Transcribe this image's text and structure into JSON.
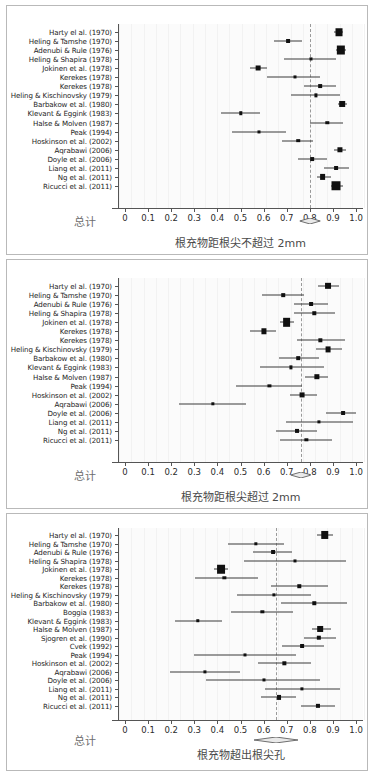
{
  "figure": {
    "panel_count": 3,
    "marker_color": "#101010",
    "ci_color": "#3a3a3a",
    "refline_color": "#9a9a9a",
    "total_label": "总计",
    "axis_ticks": [
      "0",
      "0.1",
      "0.2",
      "0.3",
      "0.4",
      "0.5",
      "0.6",
      "0.7",
      "0.8",
      "0.9",
      "1.0"
    ],
    "axis_tick_values": [
      0,
      0.1,
      0.2,
      0.3,
      0.4,
      0.5,
      0.6,
      0.7,
      0.8,
      0.9,
      1.0
    ]
  },
  "chart_data": [
    {
      "type": "forest",
      "panel_id": 1,
      "title": "",
      "xlabel": "根充物距根尖不超过 2mm",
      "ylabel": "",
      "xlim": [
        -0.03,
        1.03
      ],
      "xticks": [
        0,
        0.1,
        0.2,
        0.3,
        0.4,
        0.5,
        0.6,
        0.7,
        0.8,
        0.9,
        1.0
      ],
      "xticklabels": [
        "0",
        "0.1",
        "0.2",
        "0.3",
        "0.4",
        "0.5",
        "0.6",
        "0.7",
        "0.8",
        "0.9",
        "1.0"
      ],
      "grid": false,
      "legend": "none",
      "reference_line": 0.8,
      "summary": {
        "label": "总计",
        "estimate": 0.8,
        "ci_low": 0.755,
        "ci_high": 0.845
      },
      "studies": [
        {
          "label": "Harty el al. (1970)",
          "estimate": 0.925,
          "ci_low": 0.905,
          "ci_high": 0.945,
          "weight": 4.0
        },
        {
          "label": "Heling & Tamshe (1970)",
          "estimate": 0.705,
          "ci_low": 0.645,
          "ci_high": 0.765,
          "weight": 1.6
        },
        {
          "label": "Adenubi & Rule (1976)",
          "estimate": 0.935,
          "ci_low": 0.915,
          "ci_high": 0.955,
          "weight": 5.0
        },
        {
          "label": "Heling & Shapira (1978)",
          "estimate": 0.805,
          "ci_low": 0.69,
          "ci_high": 0.915,
          "weight": 1.0
        },
        {
          "label": "Jokinen et al. (1978)",
          "estimate": 0.575,
          "ci_low": 0.54,
          "ci_high": 0.615,
          "weight": 2.3
        },
        {
          "label": "Kerekes (1978)",
          "estimate": 0.735,
          "ci_low": 0.615,
          "ci_high": 0.845,
          "weight": 1.0
        },
        {
          "label": "Kerekes (1978)",
          "estimate": 0.845,
          "ci_low": 0.775,
          "ci_high": 0.915,
          "weight": 1.5
        },
        {
          "label": "Heling & Kischinovsky (1979)",
          "estimate": 0.825,
          "ci_low": 0.72,
          "ci_high": 0.93,
          "weight": 1.1
        },
        {
          "label": "Barbakow et al. (1980)",
          "estimate": 0.94,
          "ci_low": 0.92,
          "ci_high": 0.96,
          "weight": 3.0
        },
        {
          "label": "Klevant & Eggink (1983)",
          "estimate": 0.5,
          "ci_low": 0.415,
          "ci_high": 0.585,
          "weight": 1.3
        },
        {
          "label": "Halse & Molven (1987)",
          "estimate": 0.875,
          "ci_low": 0.8,
          "ci_high": 0.945,
          "weight": 1.3
        },
        {
          "label": "Peak (1994)",
          "estimate": 0.58,
          "ci_low": 0.465,
          "ci_high": 0.695,
          "weight": 1.0
        },
        {
          "label": "Hoskinson et al. (2002)",
          "estimate": 0.75,
          "ci_low": 0.68,
          "ci_high": 0.815,
          "weight": 1.4
        },
        {
          "label": "Aqrabawi (2006)",
          "estimate": 0.93,
          "ci_low": 0.905,
          "ci_high": 0.955,
          "weight": 2.6
        },
        {
          "label": "Doyle et al. (2006)",
          "estimate": 0.81,
          "ci_low": 0.75,
          "ci_high": 0.875,
          "weight": 1.5
        },
        {
          "label": "Liang et al. (2011)",
          "estimate": 0.915,
          "ci_low": 0.86,
          "ci_high": 0.97,
          "weight": 1.6
        },
        {
          "label": "Ng et al. (2011)",
          "estimate": 0.855,
          "ci_low": 0.83,
          "ci_high": 0.89,
          "weight": 3.1
        },
        {
          "label": "Ricucci et al. (2011)",
          "estimate": 0.915,
          "ci_low": 0.89,
          "ci_high": 0.945,
          "weight": 5.6
        }
      ]
    },
    {
      "type": "forest",
      "panel_id": 2,
      "title": "",
      "xlabel": "根充物距根尖超过 2mm",
      "ylabel": "",
      "xlim": [
        -0.03,
        1.03
      ],
      "xticks": [
        0,
        0.1,
        0.2,
        0.3,
        0.4,
        0.5,
        0.6,
        0.7,
        0.8,
        0.9,
        1.0
      ],
      "xticklabels": [
        "0",
        "0.1",
        "0.2",
        "0.3",
        "0.4",
        "0.5",
        "0.6",
        "0.7",
        "0.8",
        "0.9",
        "1.0"
      ],
      "grid": false,
      "legend": "none",
      "reference_line": 0.76,
      "summary": {
        "label": "总计",
        "estimate": 0.76,
        "ci_low": 0.715,
        "ci_high": 0.805
      },
      "studies": [
        {
          "label": "Harty el al. (1970)",
          "estimate": 0.88,
          "ci_low": 0.835,
          "ci_high": 0.925,
          "weight": 3.2
        },
        {
          "label": "Heling & Tamshe (1970)",
          "estimate": 0.685,
          "ci_low": 0.595,
          "ci_high": 0.775,
          "weight": 1.4
        },
        {
          "label": "Adenubi & Rule (1976)",
          "estimate": 0.805,
          "ci_low": 0.73,
          "ci_high": 0.88,
          "weight": 1.6
        },
        {
          "label": "Heling & Shapira (1978)",
          "estimate": 0.82,
          "ci_low": 0.73,
          "ci_high": 0.91,
          "weight": 1.3
        },
        {
          "label": "Jokinen et al. (1978)",
          "estimate": 0.7,
          "ci_low": 0.67,
          "ci_high": 0.73,
          "weight": 4.6
        },
        {
          "label": "Kerekes (1978)",
          "estimate": 0.6,
          "ci_low": 0.54,
          "ci_high": 0.655,
          "weight": 2.6
        },
        {
          "label": "Kerekes (1978)",
          "estimate": 0.845,
          "ci_low": 0.745,
          "ci_high": 0.95,
          "weight": 1.2
        },
        {
          "label": "Heling & Kischinovsky (1979)",
          "estimate": 0.88,
          "ci_low": 0.825,
          "ci_high": 0.94,
          "weight": 2.4
        },
        {
          "label": "Barbakow et al. (1980)",
          "estimate": 0.75,
          "ci_low": 0.665,
          "ci_high": 0.84,
          "weight": 1.4
        },
        {
          "label": "Klevant & Eggink (1983)",
          "estimate": 0.72,
          "ci_low": 0.585,
          "ci_high": 0.86,
          "weight": 1.1
        },
        {
          "label": "Halse & Molven (1987)",
          "estimate": 0.83,
          "ci_low": 0.78,
          "ci_high": 0.88,
          "weight": 2.7
        },
        {
          "label": "Peak (1994)",
          "estimate": 0.625,
          "ci_low": 0.48,
          "ci_high": 0.765,
          "weight": 1.1
        },
        {
          "label": "Hoskinson et al. (2002)",
          "estimate": 0.765,
          "ci_low": 0.715,
          "ci_high": 0.83,
          "weight": 2.4
        },
        {
          "label": "Aqrabawi (2006)",
          "estimate": 0.38,
          "ci_low": 0.235,
          "ci_high": 0.525,
          "weight": 1.2
        },
        {
          "label": "Doyle et al. (2006)",
          "estimate": 0.945,
          "ci_low": 0.87,
          "ci_high": 1.0,
          "weight": 1.6
        },
        {
          "label": "Liang et al. (2011)",
          "estimate": 0.84,
          "ci_low": 0.695,
          "ci_high": 0.985,
          "weight": 1.1
        },
        {
          "label": "Ng et al. (2011)",
          "estimate": 0.745,
          "ci_low": 0.655,
          "ci_high": 0.83,
          "weight": 1.7
        },
        {
          "label": "Ricucci et al. (2011)",
          "estimate": 0.785,
          "ci_low": 0.67,
          "ci_high": 0.895,
          "weight": 1.2
        }
      ]
    },
    {
      "type": "forest",
      "panel_id": 3,
      "title": "",
      "xlabel": "根充物超出根尖孔",
      "ylabel": "",
      "xlim": [
        -0.03,
        1.03
      ],
      "xticks": [
        0,
        0.1,
        0.2,
        0.3,
        0.4,
        0.5,
        0.6,
        0.7,
        0.8,
        0.9,
        1.0
      ],
      "xticklabels": [
        "0",
        "0.1",
        "0.2",
        "0.3",
        "0.4",
        "0.5",
        "0.6",
        "0.7",
        "0.8",
        "0.9",
        "1.0"
      ],
      "grid": false,
      "legend": "none",
      "reference_line": 0.655,
      "summary": {
        "label": "总计",
        "estimate": 0.655,
        "ci_low": 0.56,
        "ci_high": 0.75
      },
      "studies": [
        {
          "label": "Harty el al. (1970)",
          "estimate": 0.865,
          "ci_low": 0.83,
          "ci_high": 0.9,
          "weight": 4.4
        },
        {
          "label": "Heling & Tamshe (1970)",
          "estimate": 0.565,
          "ci_low": 0.445,
          "ci_high": 0.69,
          "weight": 1.2
        },
        {
          "label": "Adenubi & Rule (1976)",
          "estimate": 0.64,
          "ci_low": 0.555,
          "ci_high": 0.725,
          "weight": 1.6
        },
        {
          "label": "Heling & Shapira (1978)",
          "estimate": 0.735,
          "ci_low": 0.515,
          "ci_high": 0.955,
          "weight": 1.0
        },
        {
          "label": "Jokinen et al. (1978)",
          "estimate": 0.415,
          "ci_low": 0.385,
          "ci_high": 0.445,
          "weight": 4.7
        },
        {
          "label": "Kerekes (1978)",
          "estimate": 0.43,
          "ci_low": 0.305,
          "ci_high": 0.575,
          "weight": 1.2
        },
        {
          "label": "Kerekes (1978)",
          "estimate": 0.755,
          "ci_low": 0.63,
          "ci_high": 0.88,
          "weight": 1.3
        },
        {
          "label": "Heling & Kischinovsky (1979)",
          "estimate": 0.645,
          "ci_low": 0.485,
          "ci_high": 0.805,
          "weight": 1.1
        },
        {
          "label": "Barbakow et al. (1980)",
          "estimate": 0.82,
          "ci_low": 0.675,
          "ci_high": 0.96,
          "weight": 1.3
        },
        {
          "label": "Boggia (1983)",
          "estimate": 0.595,
          "ci_low": 0.46,
          "ci_high": 0.725,
          "weight": 1.2
        },
        {
          "label": "Klevant & Eggink (1983)",
          "estimate": 0.315,
          "ci_low": 0.215,
          "ci_high": 0.42,
          "weight": 1.3
        },
        {
          "label": "Halse & Molven (1987)",
          "estimate": 0.845,
          "ci_low": 0.81,
          "ci_high": 0.89,
          "weight": 3.0
        },
        {
          "label": "Sjogren et al. (1990)",
          "estimate": 0.84,
          "ci_low": 0.775,
          "ci_high": 0.915,
          "weight": 2.0
        },
        {
          "label": "Cvek (1992)",
          "estimate": 0.765,
          "ci_low": 0.68,
          "ci_high": 0.86,
          "weight": 1.6
        },
        {
          "label": "Peak (1994)",
          "estimate": 0.52,
          "ci_low": 0.3,
          "ci_high": 0.74,
          "weight": 1.0
        },
        {
          "label": "Hoskinson et al. (2002)",
          "estimate": 0.69,
          "ci_low": 0.575,
          "ci_high": 0.805,
          "weight": 1.2
        },
        {
          "label": "Aqrabawi (2006)",
          "estimate": 0.345,
          "ci_low": 0.195,
          "ci_high": 0.5,
          "weight": 1.1
        },
        {
          "label": "Doyle et al. (2006)",
          "estimate": 0.6,
          "ci_low": 0.35,
          "ci_high": 0.845,
          "weight": 1.0
        },
        {
          "label": "Liang et al. (2011)",
          "estimate": 0.765,
          "ci_low": 0.605,
          "ci_high": 0.93,
          "weight": 1.1
        },
        {
          "label": "Ng et al. (2011)",
          "estimate": 0.665,
          "ci_low": 0.59,
          "ci_high": 0.74,
          "weight": 1.7
        },
        {
          "label": "Ricucci et al. (2011)",
          "estimate": 0.835,
          "ci_low": 0.76,
          "ci_high": 0.91,
          "weight": 1.8
        }
      ]
    }
  ]
}
